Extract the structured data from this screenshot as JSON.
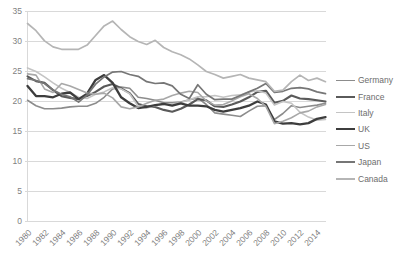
{
  "chart": {
    "type": "line",
    "title": "",
    "xlabel": "",
    "ylabel": ""
  },
  "chart_data": {
    "type": "line",
    "title": "",
    "subtitle": "",
    "xlabel": "",
    "ylabel": "",
    "xlim": [
      1980,
      2015
    ],
    "ylim": [
      0,
      35
    ],
    "yticks": [
      0,
      5,
      10,
      15,
      20,
      25,
      30,
      35
    ],
    "ytick_labels": [
      "0",
      "5",
      "10",
      "15",
      "20",
      "25",
      "30",
      "35"
    ],
    "xticks": [
      1980,
      1982,
      1984,
      1986,
      1988,
      1990,
      1992,
      1994,
      1996,
      1998,
      2000,
      2002,
      2004,
      2006,
      2008,
      2010,
      2012,
      2014
    ],
    "xtick_labels": [
      "1980",
      "1982",
      "1984",
      "1986",
      "1988",
      "1990",
      "1992",
      "1994",
      "1996",
      "1998",
      "2000",
      "2002",
      "2004",
      "2006",
      "2008",
      "2010",
      "2012",
      "2014"
    ],
    "x": [
      1980,
      1981,
      1982,
      1983,
      1984,
      1985,
      1986,
      1987,
      1988,
      1989,
      1990,
      1991,
      1992,
      1993,
      1994,
      1995,
      1996,
      1997,
      1998,
      1999,
      2000,
      2001,
      2002,
      2003,
      2004,
      2005,
      2006,
      2007,
      2008,
      2009,
      2010,
      2011,
      2012,
      2013,
      2014,
      2015
    ],
    "grid": "horizontal",
    "legend_position": "right",
    "series": [
      {
        "name": "Germany",
        "color": "#8c8c8c",
        "width": 1.6,
        "values": [
          20.2,
          19.3,
          18.8,
          18.8,
          18.9,
          19.1,
          19.2,
          19.2,
          19.7,
          20.7,
          22.1,
          22.4,
          22.2,
          20.7,
          20.5,
          20.2,
          19.8,
          19.8,
          19.9,
          20.3,
          20.6,
          19.5,
          18.1,
          17.9,
          17.7,
          17.5,
          18.4,
          19.2,
          19.3,
          17.0,
          18.0,
          19.3,
          19.0,
          19.2,
          19.4,
          19.7
        ]
      },
      {
        "name": "France",
        "color": "#5a5a5a",
        "width": 2.1,
        "values": [
          24.2,
          23.4,
          23.1,
          21.9,
          20.9,
          20.6,
          20.4,
          20.9,
          21.6,
          22.5,
          22.9,
          22.2,
          21.4,
          19.6,
          19.2,
          19.1,
          18.6,
          18.3,
          18.8,
          19.5,
          20.4,
          20.2,
          19.2,
          19.1,
          19.5,
          20.0,
          20.7,
          21.6,
          21.8,
          19.8,
          20.1,
          21.0,
          20.5,
          20.4,
          20.2,
          20.0
        ]
      },
      {
        "name": "Italy",
        "color": "#c4c4c4",
        "width": 1.6,
        "values": [
          25.6,
          25.0,
          24.1,
          23.1,
          22.2,
          21.5,
          20.7,
          20.5,
          21.2,
          21.6,
          22.3,
          22.1,
          21.3,
          19.2,
          18.9,
          19.3,
          19.5,
          19.6,
          19.8,
          20.3,
          20.8,
          20.8,
          21.0,
          20.7,
          21.0,
          21.1,
          21.6,
          21.8,
          21.4,
          19.4,
          20.0,
          19.7,
          18.2,
          17.4,
          16.9,
          17.0
        ]
      },
      {
        "name": "UK",
        "color": "#3d3d3d",
        "width": 2.3,
        "values": [
          22.6,
          20.9,
          20.9,
          20.7,
          21.3,
          21.5,
          20.4,
          21.3,
          23.6,
          24.4,
          23.1,
          20.7,
          19.7,
          18.9,
          19.1,
          19.4,
          19.6,
          19.3,
          19.7,
          19.3,
          19.3,
          19.2,
          18.6,
          18.3,
          18.6,
          18.9,
          19.3,
          20.0,
          19.5,
          16.7,
          16.3,
          16.4,
          16.2,
          16.4,
          17.1,
          17.4
        ]
      },
      {
        "name": "US",
        "color": "#a8a8a8",
        "width": 1.6,
        "values": [
          24.6,
          24.4,
          22.1,
          21.5,
          23.0,
          22.6,
          22.0,
          21.4,
          21.2,
          21.4,
          20.6,
          19.1,
          18.8,
          19.1,
          19.7,
          20.2,
          20.4,
          21.0,
          21.4,
          21.7,
          21.5,
          20.1,
          19.4,
          19.5,
          20.1,
          20.8,
          21.3,
          20.5,
          19.2,
          16.3,
          16.7,
          17.3,
          18.1,
          18.4,
          19.1,
          19.5
        ]
      },
      {
        "name": "Japan",
        "color": "#767676",
        "width": 1.7,
        "values": [
          23.8,
          23.5,
          23.0,
          21.9,
          21.2,
          20.8,
          19.9,
          21.1,
          22.9,
          24.1,
          24.9,
          25.0,
          24.5,
          24.2,
          23.3,
          23.0,
          23.1,
          22.6,
          21.2,
          20.5,
          22.8,
          21.2,
          20.3,
          20.4,
          20.4,
          21.0,
          21.6,
          22.2,
          23.0,
          21.5,
          21.7,
          22.2,
          22.3,
          22.1,
          21.6,
          21.3
        ]
      },
      {
        "name": "Canada",
        "color": "#b5b5b5",
        "width": 1.7,
        "values": [
          33.0,
          31.8,
          30.1,
          29.1,
          28.7,
          28.7,
          28.7,
          29.4,
          31.0,
          32.6,
          33.4,
          32.0,
          30.8,
          30.0,
          29.5,
          30.2,
          29.0,
          28.3,
          27.8,
          27.1,
          26.1,
          25.0,
          24.5,
          23.9,
          24.2,
          24.5,
          23.9,
          23.6,
          23.3,
          21.7,
          21.9,
          23.3,
          24.4,
          23.5,
          23.9,
          23.3
        ]
      }
    ]
  },
  "legend": {
    "items": [
      {
        "label": "Germany"
      },
      {
        "label": "France"
      },
      {
        "label": "Italy"
      },
      {
        "label": "UK"
      },
      {
        "label": "US"
      },
      {
        "label": "Japan"
      },
      {
        "label": "Canada"
      }
    ]
  },
  "style": {
    "grid_color": "#d9d9d9",
    "axis_color": "#d9d9d9",
    "tick_text_color": "#7f7f7f",
    "legend_text_color": "#6d6d6d",
    "background": "#ffffff"
  }
}
